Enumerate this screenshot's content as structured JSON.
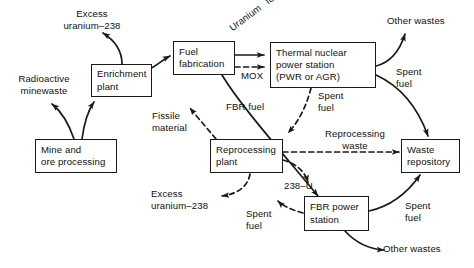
{
  "diagram": {
    "colors": {
      "line": "#1a1a1a",
      "text": "#111111",
      "background": "#ffffff"
    },
    "nodes": [
      {
        "id": "enrichment-plant",
        "lines": [
          "Enrichment",
          "plant"
        ]
      },
      {
        "id": "fuel-fabrication",
        "lines": [
          "Fuel",
          "fabrication"
        ]
      },
      {
        "id": "thermal-power-station",
        "lines": [
          "Thermal nuclear",
          "power station",
          "(PWR or AGR)"
        ]
      },
      {
        "id": "mine-ore-processing",
        "lines": [
          "Mine and",
          "ore processing"
        ]
      },
      {
        "id": "reprocessing-plant",
        "lines": [
          "Reprocessing",
          "plant"
        ]
      },
      {
        "id": "waste-repository",
        "lines": [
          "Waste",
          "repository"
        ]
      },
      {
        "id": "fbr-power-station",
        "lines": [
          "FBR power",
          "station"
        ]
      }
    ],
    "labels": [
      {
        "id": "excess-uranium-238-top",
        "lines": [
          "Excess",
          "uranium–238"
        ]
      },
      {
        "id": "radioactive-minewaste",
        "lines": [
          "Radioactive",
          "minewaste"
        ]
      },
      {
        "id": "uranium-fuel",
        "lines": [
          "Uranium",
          "fuel"
        ]
      },
      {
        "id": "mox",
        "lines": [
          "MOX"
        ]
      },
      {
        "id": "other-wastes-top",
        "lines": [
          "Other wastes"
        ]
      },
      {
        "id": "spent-fuel-right-top",
        "lines": [
          "Spent",
          "fuel"
        ]
      },
      {
        "id": "spent-fuel-thermal",
        "lines": [
          "Spent",
          "fuel"
        ]
      },
      {
        "id": "fbr-fuel",
        "lines": [
          "FBR fuel"
        ]
      },
      {
        "id": "fissile-material",
        "lines": [
          "Fissile",
          "material"
        ]
      },
      {
        "id": "reprocessing-waste",
        "lines": [
          "Reprocessing",
          "waste"
        ]
      },
      {
        "id": "excess-uranium-238-bottom",
        "lines": [
          "Excess",
          "uranium–238"
        ]
      },
      {
        "id": "spent-fuel-bottom-left",
        "lines": [
          "Spent",
          "fuel"
        ]
      },
      {
        "id": "u-238",
        "lines": [
          "238–U"
        ]
      },
      {
        "id": "spent-fuel-right-bottom",
        "lines": [
          "Spent",
          "fuel"
        ]
      },
      {
        "id": "other-wastes-bottom",
        "lines": [
          "Other wastes"
        ]
      }
    ]
  }
}
